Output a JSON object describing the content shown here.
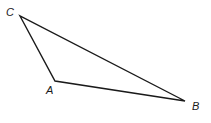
{
  "diagram": {
    "type": "triangle",
    "stroke_color": "#1a1a1a",
    "background": "#ffffff",
    "vertices": {
      "A": {
        "label": "A",
        "x": 55,
        "y": 81,
        "label_x": 46,
        "label_y": 94
      },
      "B": {
        "label": "B",
        "x": 185,
        "y": 101,
        "label_x": 192,
        "label_y": 110
      },
      "C": {
        "label": "C",
        "x": 20,
        "y": 16,
        "label_x": 6,
        "label_y": 16
      }
    },
    "edges": [
      {
        "from": "C",
        "to": "A"
      },
      {
        "from": "A",
        "to": "B"
      },
      {
        "from": "B",
        "to": "C"
      }
    ]
  }
}
